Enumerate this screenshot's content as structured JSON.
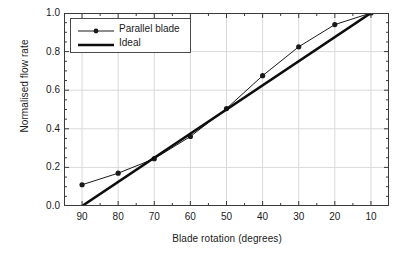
{
  "chart_data": {
    "type": "line",
    "title": "",
    "xlabel": "Blade rotation (degrees)",
    "ylabel": "Normalised flow rate",
    "xlim": [
      95,
      5
    ],
    "ylim": [
      0.0,
      1.0
    ],
    "x_tick_labels": [
      "90",
      "80",
      "70",
      "60",
      "50",
      "40",
      "30",
      "20",
      "10"
    ],
    "x_ticks": [
      90,
      80,
      70,
      60,
      50,
      40,
      30,
      20,
      10
    ],
    "x_minor_step": 5,
    "y_tick_labels": [
      "0.0",
      "0.2",
      "0.4",
      "0.6",
      "0.8",
      "1.0"
    ],
    "y_ticks": [
      0.0,
      0.2,
      0.4,
      0.6,
      0.8,
      1.0
    ],
    "y_minor_step": 0.05,
    "x_axis_reversed": true,
    "grid": true,
    "grid_color": "#d9d9d9",
    "axis_color": "#3a3a3a",
    "legend_position": "upper left",
    "series": [
      {
        "name": "Parallel blade",
        "style": "line-with-markers",
        "color": "#1a1a1a",
        "line_width": 1,
        "marker": "filled-circle",
        "x": [
          90,
          80,
          70,
          60,
          50,
          40,
          30,
          20,
          10
        ],
        "values": [
          0.11,
          0.17,
          0.245,
          0.36,
          0.505,
          0.675,
          0.825,
          0.94,
          1.0
        ]
      },
      {
        "name": "Ideal",
        "style": "solid-line",
        "color": "#0d0d0d",
        "line_width": 2.6,
        "marker": "none",
        "x": [
          90,
          10
        ],
        "values": [
          0.0,
          1.0
        ]
      }
    ]
  },
  "legend": {
    "items": [
      {
        "label": "Parallel blade",
        "sample": "line-marker-sample"
      },
      {
        "label": "Ideal",
        "sample": "thick-line-sample"
      }
    ]
  }
}
